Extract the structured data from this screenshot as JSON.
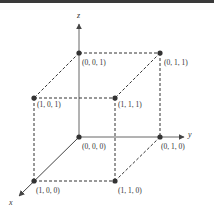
{
  "diagram": {
    "type": "unit-cube-3d",
    "axes": {
      "x": {
        "label": "x"
      },
      "y": {
        "label": "y"
      },
      "z": {
        "label": "z"
      }
    },
    "vertices": [
      {
        "id": "v000",
        "label": "(0, 0, 0)"
      },
      {
        "id": "v001",
        "label": "(0, 0, 1)"
      },
      {
        "id": "v010",
        "label": "(0, 1, 0)"
      },
      {
        "id": "v011",
        "label": "(0, 1, 1)"
      },
      {
        "id": "v100",
        "label": "(1, 0, 0)"
      },
      {
        "id": "v101",
        "label": "(1, 0, 1)"
      },
      {
        "id": "v110",
        "label": "(1, 1, 0)"
      },
      {
        "id": "v111",
        "label": "(1, 1, 1)"
      }
    ],
    "colors": {
      "line": "#333333",
      "axis": "#555555",
      "point": "#333333",
      "top_band": "#3a3a3a"
    }
  }
}
